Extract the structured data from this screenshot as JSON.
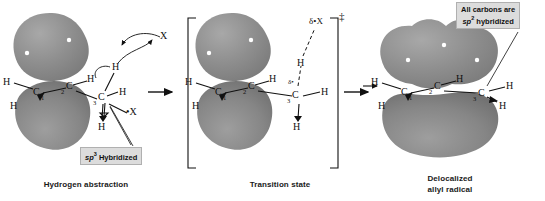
{
  "figure": {
    "background_color": "#ffffff",
    "orbital_color": "#8a8a8a",
    "line_color": "#111111"
  },
  "panels": [
    {
      "id": "reactant",
      "caption": "Hydrogen abstraction",
      "callout": {
        "line1": "sp",
        "sup": "3",
        "line2": " Hybridized"
      },
      "atoms": {
        "c1": "C",
        "c1_sub": "1",
        "c2": "C",
        "c2_sub": "2",
        "c3": "C",
        "c3_sub": "3",
        "h_c1_up": "H",
        "h_c1_down": "H",
        "h_c2": "H",
        "h_c3_up": "H",
        "h_c3_right": "H",
        "h_c3_down": "H",
        "radical_x": "•X",
        "incoming_x": "X"
      }
    },
    {
      "id": "transition-state",
      "caption": "Transition state",
      "dagger": "‡",
      "atoms": {
        "c1": "C",
        "c1_sub": "1",
        "c2": "C",
        "c2_sub": "2",
        "c3": "C",
        "c3_sub": "3",
        "h_c1_up": "H",
        "h_c1_down": "H",
        "h_c2": "H",
        "h_c3_right": "H",
        "h_c3_down": "H",
        "h_transfer": "H",
        "delta_x": "δ•X",
        "delta_c3": "δ•"
      }
    },
    {
      "id": "product",
      "caption_line1": "Delocalized",
      "caption_line2": "allyl radical",
      "callout": {
        "line1": "All carbons are",
        "line2_pre": "sp",
        "line2_sup": "2",
        "line2_post": " hybridized"
      },
      "atoms": {
        "c1": "C",
        "c1_sub": "1",
        "c2": "C",
        "c2_sub": "2",
        "c3": "C",
        "c3_sub": "3",
        "h_c1_up": "H",
        "h_c1_down": "H",
        "h_c2": "H",
        "h_c3_up": "H",
        "h_c3_down": "H"
      }
    }
  ],
  "arrows": {
    "reaction_1": "reaction-arrow",
    "reaction_2": "reaction-arrow",
    "curved": "curved-electron-arrow"
  }
}
